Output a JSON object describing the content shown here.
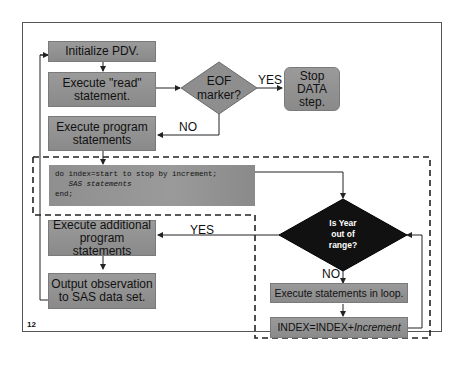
{
  "slide": {
    "page_number": "12"
  },
  "flowchart": {
    "initialize": "Initialize PDV.",
    "read_line1": "Execute \"read\"",
    "read_line2": "statement.",
    "eof_line1": "EOF",
    "eof_line2": "marker?",
    "yes_label": "YES",
    "stop_line1": "Stop",
    "stop_line2": "DATA",
    "stop_line3": "step.",
    "no_label": "NO",
    "program_line1": "Execute program",
    "program_line2": "statements",
    "code": {
      "line1": "do index=start to stop by increment;",
      "line2": "   SAS statements",
      "line3": "end;"
    },
    "additional_line1": "Execute additional",
    "additional_line2": "program statements",
    "loop_yes_label": "YES",
    "output_line1": "Output observation",
    "output_line2": "to SAS data set.",
    "decision_line1": "Is Year",
    "decision_line2": "out of",
    "decision_line3": "range?",
    "loop_no_label": "NO",
    "loop_execute": "Execute statements in loop.",
    "increment_prefix": "INDEX=INDEX+",
    "increment_var": "Increment"
  }
}
